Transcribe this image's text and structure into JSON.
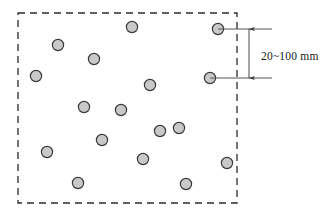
{
  "figure": {
    "background_color": "#ffffff"
  },
  "boundary": {
    "name": "dashed-boundary-rectangle",
    "style": "dashed",
    "stroke_color": "#2b2b2b",
    "fill": "none",
    "x": 18,
    "y": 13,
    "width": 219,
    "height": 190,
    "dash_pattern": "7 5",
    "stroke_width": 1.3
  },
  "particles": {
    "name": "aggregate-particles",
    "count": 17,
    "fill_color": "#c9c9c9",
    "stroke_color": "#3a3a3a",
    "radius": 5.6,
    "items": [
      {
        "id": "particle-1",
        "cx": 132,
        "cy": 27
      },
      {
        "id": "particle-2",
        "cx": 218,
        "cy": 29
      },
      {
        "id": "particle-3",
        "cx": 58,
        "cy": 45
      },
      {
        "id": "particle-4",
        "cx": 94,
        "cy": 59
      },
      {
        "id": "particle-5",
        "cx": 36,
        "cy": 76
      },
      {
        "id": "particle-6",
        "cx": 210,
        "cy": 78
      },
      {
        "id": "particle-7",
        "cx": 150,
        "cy": 85
      },
      {
        "id": "particle-8",
        "cx": 84,
        "cy": 107
      },
      {
        "id": "particle-9",
        "cx": 179,
        "cy": 128
      },
      {
        "id": "particle-10",
        "cx": 47,
        "cy": 152
      },
      {
        "id": "particle-11",
        "cx": 143,
        "cy": 159
      },
      {
        "id": "particle-12",
        "cx": 227,
        "cy": 163
      },
      {
        "id": "particle-13",
        "cx": 78,
        "cy": 183
      },
      {
        "id": "particle-14",
        "cx": 186,
        "cy": 184
      },
      {
        "id": "particle-15",
        "cx": 121,
        "cy": 110
      },
      {
        "id": "particle-16",
        "cx": 160,
        "cy": 131
      },
      {
        "id": "particle-17",
        "cx": 102,
        "cy": 140
      }
    ]
  },
  "dimension": {
    "name": "spacing-dimension",
    "label": "20~100 mm",
    "stroke_color": "#4a4a4a",
    "label_color": "#1a1a1a",
    "extension_line_top": {
      "x1": 218,
      "y1": 29,
      "x2": 272,
      "y2": 29
    },
    "extension_line_bottom": {
      "x1": 210,
      "y1": 78,
      "x2": 272,
      "y2": 78
    },
    "arrow_line": {
      "x": 249,
      "y1": 29,
      "y2": 78
    },
    "label_position": {
      "x": 261,
      "y": 57
    },
    "measured_from": "particle-2",
    "measured_to": "particle-6"
  }
}
